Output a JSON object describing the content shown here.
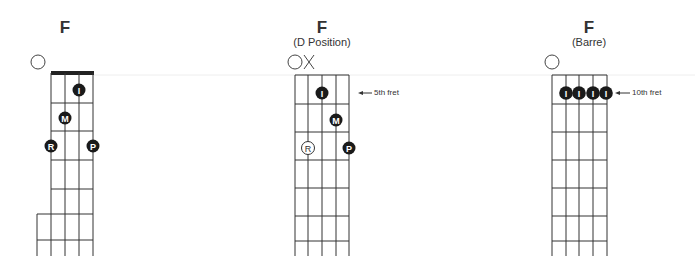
{
  "colors": {
    "line": "#333333",
    "dot": "#1a1a1a",
    "dot_text": "#ffffff",
    "faint": "#e8e8e8"
  },
  "chords": [
    {
      "title": "F",
      "subtitle": "",
      "open_marker": "O",
      "fingers": [
        {
          "label": "I",
          "string": 3,
          "fret": 1
        },
        {
          "label": "M",
          "string": 2,
          "fret": 2
        },
        {
          "label": "R",
          "string": 1,
          "fret": 3
        },
        {
          "label": "P",
          "string": 4,
          "fret": 3
        }
      ],
      "fret_label": ""
    },
    {
      "title": "F",
      "subtitle": "(D Position)",
      "open_marker": "O",
      "muted_marker": "X",
      "fingers": [
        {
          "label": "I",
          "string": 3,
          "fret": 1
        },
        {
          "label": "M",
          "string": 4,
          "fret": 2
        },
        {
          "label": "R",
          "string": 2,
          "fret": 3,
          "style": "outline"
        },
        {
          "label": "P",
          "string": 5,
          "fret": 3
        }
      ],
      "fret_label": "5th fret"
    },
    {
      "title": "F",
      "subtitle": "(Barre)",
      "open_marker": "O",
      "fingers": [
        {
          "label": "I",
          "string": 2,
          "fret": 1
        },
        {
          "label": "I",
          "string": 3,
          "fret": 1
        },
        {
          "label": "I",
          "string": 4,
          "fret": 1
        },
        {
          "label": "I",
          "string": 5,
          "fret": 1
        }
      ],
      "fret_label": "10th fret"
    }
  ]
}
